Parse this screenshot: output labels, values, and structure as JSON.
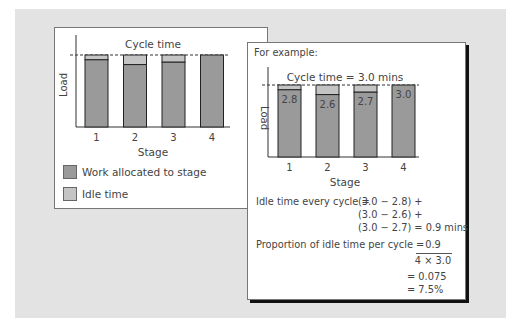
{
  "colors": {
    "work": "#9a9a9a",
    "idle": "#c4c4c4",
    "background": "#e3e3e3"
  },
  "chart_data": [
    {
      "type": "bar",
      "stacked": true,
      "title": "Cycle time",
      "xlabel": "Stage",
      "ylabel": "Load",
      "categories": [
        "1",
        "2",
        "3",
        "4"
      ],
      "series": [
        {
          "name": "Work allocated to stage",
          "values": [
            2.8,
            2.6,
            2.7,
            3.0
          ]
        },
        {
          "name": "Idle time",
          "values": [
            0.2,
            0.4,
            0.3,
            0.0
          ]
        }
      ],
      "cycle_time": 3.0,
      "ylim": [
        0,
        3.0
      ],
      "legend": [
        "Work allocated to stage",
        "Idle time"
      ],
      "legend_position": "bottom"
    },
    {
      "type": "bar",
      "stacked": true,
      "title": "Cycle time = 3.0 mins",
      "xlabel": "Stage",
      "ylabel": "Load",
      "categories": [
        "1",
        "2",
        "3",
        "4"
      ],
      "series": [
        {
          "name": "Work allocated to stage",
          "values": [
            2.8,
            2.6,
            2.7,
            3.0
          ],
          "labels": [
            "2.8",
            "2.6",
            "2.7",
            "3.0"
          ]
        },
        {
          "name": "Idle time",
          "values": [
            0.2,
            0.4,
            0.3,
            0.0
          ]
        }
      ],
      "cycle_time": 3.0,
      "ylim": [
        0,
        3.0
      ]
    }
  ],
  "panel2": {
    "heading": "For example:",
    "idle_label": "Idle time every cycle =",
    "idle_lines": [
      "(3.0 − 2.8) +",
      "(3.0 − 2.6) +",
      "(3.0 − 2.7) = 0.9 mins"
    ],
    "proportion_label": "Proportion of idle time per cycle  =",
    "numerator": "0.9",
    "denominator": "4 × 3.0",
    "result1": "= 0.075",
    "result2": "= 7.5%"
  }
}
